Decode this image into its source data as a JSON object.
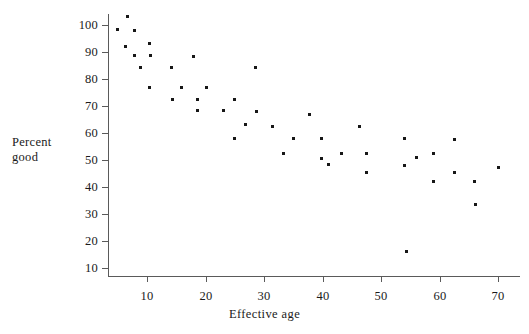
{
  "chart_data": {
    "type": "scatter",
    "title": "",
    "xlabel": "Effective age",
    "ylabel_line1": "Percent",
    "ylabel_line2": "good",
    "xlim": [
      3,
      73
    ],
    "ylim": [
      8,
      106
    ],
    "xticks": [
      10,
      20,
      30,
      40,
      50,
      60,
      70
    ],
    "yticks": [
      10,
      20,
      30,
      40,
      50,
      60,
      70,
      80,
      90,
      100
    ],
    "xtick_labels": [
      "10",
      "20",
      "30",
      "40",
      "50",
      "60",
      "70"
    ],
    "ytick_labels": [
      "10",
      "20",
      "30",
      "40",
      "50",
      "60",
      "70",
      "80",
      "90",
      "100"
    ],
    "grid": false,
    "legend": false,
    "marker": "square",
    "marker_color": "#171717",
    "axis_color": "#5a5a5a",
    "background": "#ffffff",
    "points": [
      {
        "x": 5.0,
        "y": 98.4
      },
      {
        "x": 6.6,
        "y": 103.1
      },
      {
        "x": 6.4,
        "y": 92.0
      },
      {
        "x": 7.8,
        "y": 98.0
      },
      {
        "x": 7.9,
        "y": 88.6
      },
      {
        "x": 8.9,
        "y": 84.3
      },
      {
        "x": 10.4,
        "y": 93.3
      },
      {
        "x": 10.6,
        "y": 88.6
      },
      {
        "x": 10.4,
        "y": 76.9
      },
      {
        "x": 14.2,
        "y": 84.2
      },
      {
        "x": 14.3,
        "y": 72.5
      },
      {
        "x": 15.9,
        "y": 77.0
      },
      {
        "x": 17.9,
        "y": 88.4
      },
      {
        "x": 18.6,
        "y": 72.4
      },
      {
        "x": 18.6,
        "y": 68.2
      },
      {
        "x": 20.2,
        "y": 77.0
      },
      {
        "x": 23.1,
        "y": 68.2
      },
      {
        "x": 25.0,
        "y": 72.4
      },
      {
        "x": 25.0,
        "y": 57.9
      },
      {
        "x": 26.9,
        "y": 63.0
      },
      {
        "x": 28.6,
        "y": 84.1
      },
      {
        "x": 28.7,
        "y": 68.1
      },
      {
        "x": 31.4,
        "y": 62.4
      },
      {
        "x": 33.4,
        "y": 52.5
      },
      {
        "x": 35.1,
        "y": 57.9
      },
      {
        "x": 37.8,
        "y": 67.0
      },
      {
        "x": 39.9,
        "y": 57.9
      },
      {
        "x": 39.9,
        "y": 50.7
      },
      {
        "x": 41.0,
        "y": 48.3
      },
      {
        "x": 43.2,
        "y": 52.4
      },
      {
        "x": 46.3,
        "y": 62.3
      },
      {
        "x": 47.5,
        "y": 52.4
      },
      {
        "x": 47.6,
        "y": 45.4
      },
      {
        "x": 54.0,
        "y": 57.9
      },
      {
        "x": 54.1,
        "y": 47.8
      },
      {
        "x": 54.3,
        "y": 16.2
      },
      {
        "x": 56.0,
        "y": 51.0
      },
      {
        "x": 58.9,
        "y": 52.4
      },
      {
        "x": 58.9,
        "y": 42.1
      },
      {
        "x": 62.5,
        "y": 57.6
      },
      {
        "x": 62.6,
        "y": 45.2
      },
      {
        "x": 66.0,
        "y": 42.1
      },
      {
        "x": 66.1,
        "y": 33.4
      },
      {
        "x": 70.0,
        "y": 47.2
      }
    ]
  }
}
